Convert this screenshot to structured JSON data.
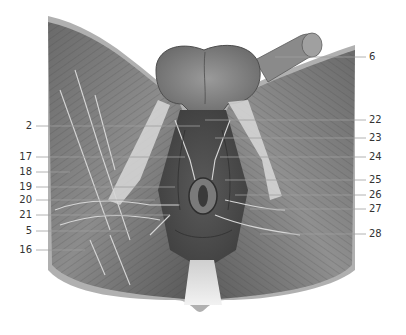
{
  "figure": {
    "type": "anatomical illustration",
    "colors": {
      "background": "#ffffff",
      "muscle_dark": "#4a4a4a",
      "muscle_mid": "#7a7a7a",
      "muscle_light": "#b8b8b8",
      "skin_edge": "#a8a8a8",
      "leader_line": "#9a9a9a",
      "label_text": "#333333"
    }
  },
  "labels": {
    "left": [
      {
        "text": "2",
        "y": 126
      },
      {
        "text": "17",
        "y": 157
      },
      {
        "text": "18",
        "y": 172
      },
      {
        "text": "19",
        "y": 187
      },
      {
        "text": "20",
        "y": 200
      },
      {
        "text": "21",
        "y": 215
      },
      {
        "text": "5",
        "y": 231
      },
      {
        "text": "16",
        "y": 250
      }
    ],
    "right": [
      {
        "text": "6",
        "y": 57
      },
      {
        "text": "22",
        "y": 120
      },
      {
        "text": "23",
        "y": 138
      },
      {
        "text": "24",
        "y": 157
      },
      {
        "text": "25",
        "y": 180
      },
      {
        "text": "26",
        "y": 195
      },
      {
        "text": "27",
        "y": 209
      },
      {
        "text": "28",
        "y": 234
      }
    ]
  }
}
